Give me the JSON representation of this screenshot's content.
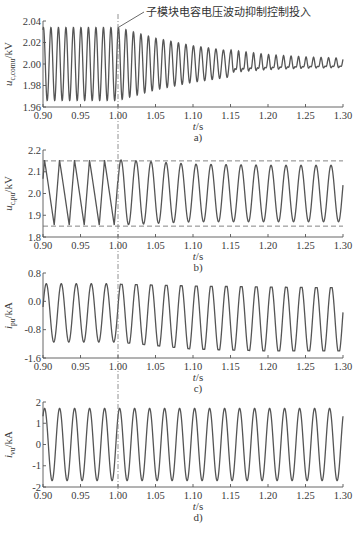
{
  "annotation": "子模块电容电压波动抑制控制投入",
  "x_axis_label": "t/s",
  "control_time": 1.0,
  "chart_data": [
    {
      "type": "line",
      "panel": "a)",
      "ylabel": "u_c,comu/kV",
      "xlabel": "t/s",
      "xlim": [
        0.9,
        1.3
      ],
      "ylim": [
        1.96,
        2.04
      ],
      "xticks": [
        "0.90",
        "0.95",
        "1.00",
        "1.05",
        "1.10",
        "1.15",
        "1.20",
        "1.25",
        "1.30"
      ],
      "yticks": [
        "2.04",
        "2.02",
        "2.00",
        "1.98",
        "1.96"
      ],
      "annotation": "子模块电容电压波动抑制控制投入",
      "series": [
        {
          "name": "u_c,comu",
          "description": "100 Hz oscillation about 2.00 kV, amplitude ~0.034 kV before t=1.00 s, decaying after control enabled to ~0.004 kV by t=1.30 s",
          "points": {
            "t": [
              0.9,
              1.0,
              1.05,
              1.1,
              1.15,
              1.2,
              1.25,
              1.3
            ],
            "amplitude": [
              0.034,
              0.034,
              0.024,
              0.017,
              0.012,
              0.008,
              0.006,
              0.005
            ],
            "mean": 2.0
          }
        }
      ]
    },
    {
      "type": "line",
      "panel": "b)",
      "ylabel": "u_c,pu/kV",
      "xlabel": "t/s",
      "xlim": [
        0.9,
        1.3
      ],
      "ylim": [
        1.8,
        2.2
      ],
      "xticks": [
        "0.90",
        "0.95",
        "1.00",
        "1.05",
        "1.10",
        "1.15",
        "1.20",
        "1.25",
        "1.30"
      ],
      "yticks": [
        "2.2",
        "2.1",
        "2.0",
        "1.9",
        "1.8"
      ],
      "reference_lines": [
        2.15,
        1.85
      ],
      "series": [
        {
          "name": "u_c,pu",
          "description": "50 Hz oscillation, before 1.00 s: 1.855-2.155 kV (sawtooth-like), after 1.00 s: 1.87-2.13 kV (sinusoidal)",
          "points": {
            "t": [
              0.9,
              1.0,
              1.1,
              1.2,
              1.3
            ],
            "max": [
              2.155,
              2.155,
              2.135,
              2.13,
              2.13
            ],
            "min": [
              1.855,
              1.855,
              1.87,
              1.87,
              1.87
            ]
          }
        }
      ]
    },
    {
      "type": "line",
      "panel": "c)",
      "ylabel": "i_pu/kA",
      "xlabel": "t/s",
      "xlim": [
        0.9,
        1.3
      ],
      "ylim": [
        -1.6,
        0.8
      ],
      "xticks": [
        "0.90",
        "0.95",
        "1.00",
        "1.05",
        "1.10",
        "1.15",
        "1.20",
        "1.25",
        "1.30"
      ],
      "yticks": [
        "0.8",
        "0.0",
        "-0.8",
        "-1.6"
      ],
      "series": [
        {
          "name": "i_pu",
          "description": "50 Hz current, before 1.00 s: -1.15 to 0.5 kA; after 1.00 s: -1.4 to 0.45 kA with flattened peaks",
          "points": {
            "t": [
              0.9,
              1.0,
              1.1,
              1.2,
              1.3
            ],
            "max": [
              0.5,
              0.5,
              0.45,
              0.42,
              0.4
            ],
            "min": [
              -1.15,
              -1.15,
              -1.35,
              -1.4,
              -1.4
            ]
          }
        }
      ]
    },
    {
      "type": "line",
      "panel": "d)",
      "ylabel": "i_vu/kA",
      "xlabel": "t/s",
      "xlim": [
        0.9,
        1.3
      ],
      "ylim": [
        -2,
        2
      ],
      "xticks": [
        "0.90",
        "0.95",
        "1.00",
        "1.05",
        "1.10",
        "1.15",
        "1.20",
        "1.25",
        "1.30"
      ],
      "yticks": [
        "2",
        "1",
        "0",
        "-1",
        "-2"
      ],
      "series": [
        {
          "name": "i_vu",
          "description": "50 Hz sinusoidal current, amplitude ~1.7 kA, unchanged before and after control",
          "points": {
            "t": [
              0.9,
              1.0,
              1.1,
              1.2,
              1.3
            ],
            "max": [
              1.7,
              1.7,
              1.7,
              1.7,
              1.7
            ],
            "min": [
              -1.7,
              -1.7,
              -1.7,
              -1.7,
              -1.7
            ]
          }
        }
      ]
    }
  ]
}
